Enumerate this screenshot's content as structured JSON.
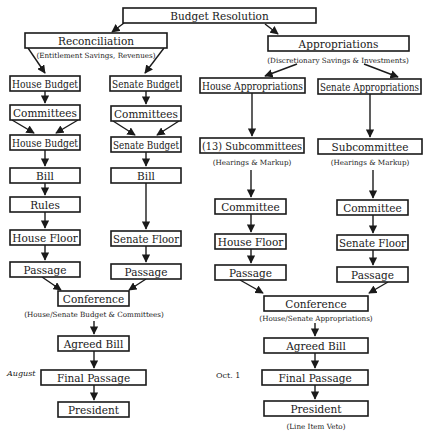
{
  "diagram": {
    "colors": {
      "stroke": "#1a1a1a",
      "background": "#ffffff",
      "box_fill": "#ffffff"
    },
    "nodes": [
      {
        "id": "budget-resolution",
        "label": "Budget Resolution",
        "x": 123,
        "y": 8,
        "w": 193,
        "h": 15
      },
      {
        "id": "reconciliation",
        "label": "Reconciliation",
        "x": 25,
        "y": 33,
        "w": 142,
        "h": 15
      },
      {
        "id": "appropriations",
        "label": "Appropriations",
        "x": 268,
        "y": 36,
        "w": 141,
        "h": 15
      },
      {
        "id": "house-budget-1",
        "label": "House Budget",
        "x": 10,
        "y": 76,
        "w": 70,
        "h": 15
      },
      {
        "id": "senate-budget-1",
        "label": "Senate Budget",
        "x": 110,
        "y": 76,
        "w": 71,
        "h": 15
      },
      {
        "id": "house-appropriations",
        "label": "House Appropriations",
        "x": 200,
        "y": 78,
        "w": 105,
        "h": 15
      },
      {
        "id": "senate-appropriations",
        "label": "Senate Appropriations",
        "x": 318,
        "y": 79,
        "w": 103,
        "h": 15
      },
      {
        "id": "committees-house",
        "label": "Committees",
        "x": 10,
        "y": 105,
        "w": 70,
        "h": 15
      },
      {
        "id": "committees-senate",
        "label": "Committees",
        "x": 111,
        "y": 106,
        "w": 70,
        "h": 15
      },
      {
        "id": "house-budget-2",
        "label": "House Budget",
        "x": 10,
        "y": 135,
        "w": 70,
        "h": 15
      },
      {
        "id": "senate-budget-2",
        "label": "Senate Budget",
        "x": 111,
        "y": 137,
        "w": 70,
        "h": 15
      },
      {
        "id": "house-subcommittees",
        "label": "(13) Subcommittees",
        "x": 200,
        "y": 138,
        "w": 104,
        "h": 15
      },
      {
        "id": "senate-subcommittee",
        "label": "Subcommittee",
        "x": 318,
        "y": 139,
        "w": 104,
        "h": 15
      },
      {
        "id": "bill-house",
        "label": "Bill",
        "x": 10,
        "y": 168,
        "w": 70,
        "h": 15
      },
      {
        "id": "bill-senate",
        "label": "Bill",
        "x": 111,
        "y": 168,
        "w": 70,
        "h": 15
      },
      {
        "id": "rules-house",
        "label": "Rules",
        "x": 10,
        "y": 197,
        "w": 70,
        "h": 15
      },
      {
        "id": "committee-house-approp",
        "label": "Committee",
        "x": 215,
        "y": 199,
        "w": 71,
        "h": 15
      },
      {
        "id": "committee-senate-approp",
        "label": "Committee",
        "x": 337,
        "y": 200,
        "w": 71,
        "h": 15
      },
      {
        "id": "house-floor-budget",
        "label": "House Floor",
        "x": 10,
        "y": 230,
        "w": 70,
        "h": 15
      },
      {
        "id": "senate-floor-budget",
        "label": "Senate Floor",
        "x": 111,
        "y": 231,
        "w": 70,
        "h": 15
      },
      {
        "id": "house-floor-approp",
        "label": "House Floor",
        "x": 215,
        "y": 234,
        "w": 71,
        "h": 15
      },
      {
        "id": "senate-floor-approp",
        "label": "Senate Floor",
        "x": 337,
        "y": 235,
        "w": 71,
        "h": 15
      },
      {
        "id": "passage-house-budget",
        "label": "Passage",
        "x": 10,
        "y": 262,
        "w": 70,
        "h": 15
      },
      {
        "id": "passage-senate-budget",
        "label": "Passage",
        "x": 111,
        "y": 264,
        "w": 70,
        "h": 15
      },
      {
        "id": "passage-house-approp",
        "label": "Passage",
        "x": 215,
        "y": 265,
        "w": 71,
        "h": 15
      },
      {
        "id": "passage-senate-approp",
        "label": "Passage",
        "x": 337,
        "y": 267,
        "w": 71,
        "h": 15
      },
      {
        "id": "conference-budget",
        "label": "Conference",
        "x": 58,
        "y": 291,
        "w": 71,
        "h": 15
      },
      {
        "id": "conference-approp",
        "label": "Conference",
        "x": 264,
        "y": 296,
        "w": 104,
        "h": 15
      },
      {
        "id": "agreed-bill-budget",
        "label": "Agreed Bill",
        "x": 58,
        "y": 336,
        "w": 71,
        "h": 15
      },
      {
        "id": "agreed-bill-approp",
        "label": "Agreed Bill",
        "x": 264,
        "y": 338,
        "w": 104,
        "h": 15
      },
      {
        "id": "final-passage-budget",
        "label": "Final Passage",
        "x": 41,
        "y": 370,
        "w": 105,
        "h": 15
      },
      {
        "id": "final-passage-approp",
        "label": "Final Passage",
        "x": 262,
        "y": 370,
        "w": 106,
        "h": 15
      },
      {
        "id": "president-budget",
        "label": "President",
        "x": 58,
        "y": 402,
        "w": 71,
        "h": 15
      },
      {
        "id": "president-approp",
        "label": "President",
        "x": 264,
        "y": 401,
        "w": 104,
        "h": 15
      }
    ],
    "annotations": [
      {
        "id": "reconciliation-note",
        "text": "(Entitlement Savings, Revenues)",
        "x": 96,
        "y": 55
      },
      {
        "id": "appropriations-note",
        "text": "(Discretionary Savings & Investments)",
        "x": 338,
        "y": 60
      },
      {
        "id": "house-subcommittees-note",
        "text": "(Hearings & Markup)",
        "x": 252,
        "y": 162
      },
      {
        "id": "senate-subcommittee-note",
        "text": "(Hearings & Markup)",
        "x": 370,
        "y": 162
      },
      {
        "id": "conference-budget-note",
        "text": "(House/Senate Budget & Committees)",
        "x": 94,
        "y": 314
      },
      {
        "id": "conference-approp-note",
        "text": "(House/Senate Appropriations)",
        "x": 316,
        "y": 318
      },
      {
        "id": "president-approp-note",
        "text": "(Line Item Veto)",
        "x": 316,
        "y": 426
      }
    ],
    "dates": [
      {
        "id": "date-august",
        "text": "August",
        "x": 7,
        "y": 373,
        "italic": true
      },
      {
        "id": "date-oct1",
        "text": "Oct. 1",
        "x": 216,
        "y": 375,
        "italic": false
      }
    ],
    "edges": [
      {
        "from": "budget-resolution",
        "to": "reconciliation",
        "x1": 124,
        "y1": 23,
        "x2": 112,
        "y2": 32
      },
      {
        "from": "budget-resolution",
        "to": "appropriations",
        "x1": 265,
        "y1": 24,
        "x2": 278,
        "y2": 34
      },
      {
        "from": "reconciliation",
        "to": "house-budget-1",
        "x1": 28,
        "y1": 48,
        "x2": 45,
        "y2": 73
      },
      {
        "from": "reconciliation",
        "to": "senate-budget-1",
        "x1": 164,
        "y1": 48,
        "x2": 145,
        "y2": 73
      },
      {
        "from": "appropriations",
        "to": "house-appropriations",
        "x1": 297,
        "y1": 64,
        "x2": 265,
        "y2": 76
      },
      {
        "from": "appropriations",
        "to": "senate-appropriations",
        "x1": 364,
        "y1": 64,
        "x2": 398,
        "y2": 77
      },
      {
        "from": "house-budget-1",
        "to": "committees-house",
        "x1": 45,
        "y1": 91,
        "x2": 45,
        "y2": 103
      },
      {
        "from": "senate-budget-1",
        "to": "committees-senate",
        "x1": 146,
        "y1": 91,
        "x2": 146,
        "y2": 104
      },
      {
        "from": "committees-house",
        "to": "house-budget-2",
        "x1": 12,
        "y1": 120,
        "x2": 34,
        "y2": 133
      },
      {
        "from": "committees-house",
        "to": "house-budget-2",
        "x1": 78,
        "y1": 120,
        "x2": 56,
        "y2": 133
      },
      {
        "from": "committees-senate",
        "to": "senate-budget-2",
        "x1": 113,
        "y1": 121,
        "x2": 135,
        "y2": 135
      },
      {
        "from": "committees-senate",
        "to": "senate-budget-2",
        "x1": 179,
        "y1": 121,
        "x2": 157,
        "y2": 135
      },
      {
        "from": "house-appropriations",
        "to": "house-subcommittees",
        "x1": 252,
        "y1": 93,
        "x2": 252,
        "y2": 136
      },
      {
        "from": "senate-appropriations",
        "to": "senate-subcommittee",
        "x1": 370,
        "y1": 94,
        "x2": 370,
        "y2": 137
      },
      {
        "from": "house-budget-2",
        "to": "bill-house",
        "x1": 45,
        "y1": 150,
        "x2": 45,
        "y2": 166
      },
      {
        "from": "senate-budget-2",
        "to": "bill-senate",
        "x1": 146,
        "y1": 152,
        "x2": 146,
        "y2": 166
      },
      {
        "from": "bill-house",
        "to": "rules-house",
        "x1": 45,
        "y1": 183,
        "x2": 45,
        "y2": 195
      },
      {
        "from": "rules-house",
        "to": "house-floor-budget",
        "x1": 45,
        "y1": 212,
        "x2": 45,
        "y2": 228
      },
      {
        "from": "bill-senate",
        "to": "senate-floor-budget",
        "x1": 146,
        "y1": 183,
        "x2": 146,
        "y2": 229
      },
      {
        "from": "house-floor-budget",
        "to": "passage-house-budget",
        "x1": 45,
        "y1": 245,
        "x2": 45,
        "y2": 260
      },
      {
        "from": "senate-floor-budget",
        "to": "passage-senate-budget",
        "x1": 146,
        "y1": 246,
        "x2": 146,
        "y2": 262
      },
      {
        "from": "house-subcommittees",
        "to": "committee-house-approp",
        "x1": 251,
        "y1": 170,
        "x2": 251,
        "y2": 197
      },
      {
        "from": "senate-subcommittee",
        "to": "committee-senate-approp",
        "x1": 373,
        "y1": 170,
        "x2": 373,
        "y2": 198
      },
      {
        "from": "committee-house-approp",
        "to": "house-floor-approp",
        "x1": 251,
        "y1": 214,
        "x2": 251,
        "y2": 232
      },
      {
        "from": "committee-senate-approp",
        "to": "senate-floor-approp",
        "x1": 373,
        "y1": 215,
        "x2": 373,
        "y2": 233
      },
      {
        "from": "house-floor-approp",
        "to": "passage-house-approp",
        "x1": 251,
        "y1": 249,
        "x2": 251,
        "y2": 263
      },
      {
        "from": "senate-floor-approp",
        "to": "passage-senate-approp",
        "x1": 373,
        "y1": 250,
        "x2": 373,
        "y2": 265
      },
      {
        "from": "passage-house-budget",
        "to": "conference-budget",
        "x1": 42,
        "y1": 277,
        "x2": 61,
        "y2": 290
      },
      {
        "from": "passage-senate-budget",
        "to": "conference-budget",
        "x1": 146,
        "y1": 279,
        "x2": 129,
        "y2": 290
      },
      {
        "from": "passage-house-approp",
        "to": "conference-approp",
        "x1": 240,
        "y1": 280,
        "x2": 263,
        "y2": 293
      },
      {
        "from": "passage-senate-approp",
        "to": "conference-approp",
        "x1": 388,
        "y1": 282,
        "x2": 369,
        "y2": 293
      },
      {
        "from": "conference-budget",
        "to": "agreed-bill-budget",
        "x1": 94,
        "y1": 321,
        "x2": 94,
        "y2": 334
      },
      {
        "from": "conference-approp",
        "to": "agreed-bill-approp",
        "x1": 315,
        "y1": 323,
        "x2": 315,
        "y2": 336
      },
      {
        "from": "agreed-bill-budget",
        "to": "final-passage-budget",
        "x1": 94,
        "y1": 351,
        "x2": 94,
        "y2": 368
      },
      {
        "from": "agreed-bill-approp",
        "to": "final-passage-approp",
        "x1": 315,
        "y1": 353,
        "x2": 315,
        "y2": 368
      },
      {
        "from": "final-passage-budget",
        "to": "president-budget",
        "x1": 94,
        "y1": 385,
        "x2": 94,
        "y2": 400
      },
      {
        "from": "final-passage-approp",
        "to": "president-approp",
        "x1": 315,
        "y1": 385,
        "x2": 315,
        "y2": 399
      }
    ]
  }
}
